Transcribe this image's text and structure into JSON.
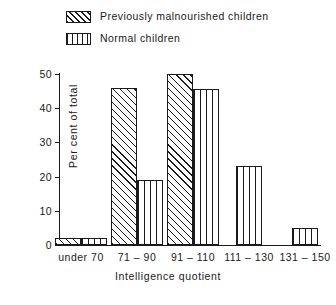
{
  "chart_data": {
    "type": "bar",
    "title": "",
    "xlabel": "Intelligence quotient",
    "ylabel": "Per cent of total",
    "categories": [
      "under 70",
      "71 – 90",
      "91 – 110",
      "111 – 130",
      "131 – 150"
    ],
    "series": [
      {
        "name": "Previously malnourished children",
        "pattern": "diagonal-hatch",
        "values": [
          2,
          46,
          50,
          0,
          0
        ]
      },
      {
        "name": "Normal children",
        "pattern": "vertical-stripe",
        "values": [
          2,
          19,
          45.5,
          23,
          5
        ]
      }
    ],
    "ylim": [
      0,
      50
    ],
    "yticks": [
      0,
      10,
      20,
      30,
      40,
      50
    ],
    "ytick_labels": [
      "0",
      "10",
      "20",
      "30",
      "40",
      "50"
    ],
    "grid": false,
    "legend_position": "top-left",
    "colors": {
      "ink": "#1a1a1a",
      "background": "#ffffff"
    }
  },
  "legend": {
    "items": [
      {
        "label": "Previously malnourished children",
        "swatch": "diagonal-hatch-swatch"
      },
      {
        "label": "Normal children",
        "swatch": "vertical-stripe-swatch"
      }
    ]
  },
  "axes": {
    "y_title": "Per cent of total",
    "x_title": "Intelligence quotient"
  }
}
